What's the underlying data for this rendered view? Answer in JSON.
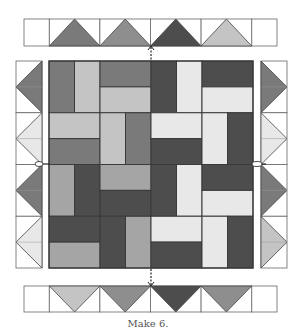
{
  "caption": "Make 6.",
  "colors": {
    "white": "#ffffff",
    "light": "#e8e8e8",
    "lightgray": "#c4c4c4",
    "mid": "#a5a5a5",
    "midgray": "#8e8e8e",
    "gray": "#7a7a7a",
    "dark": "#4d4d4d",
    "outline": "#3a3a3a"
  },
  "top_strip": {
    "direction": "up",
    "geese": [
      "gray",
      "midgray",
      "dark",
      "lightgray"
    ]
  },
  "bottom_strip": {
    "direction": "down",
    "geese": [
      "lightgray",
      "midgray",
      "dark",
      "midgray"
    ]
  },
  "left_strip": {
    "direction": "left",
    "geese": [
      "gray",
      "light",
      "gray",
      "light"
    ]
  },
  "right_strip": {
    "direction": "right",
    "geese": [
      "gray",
      "light",
      "gray",
      "lightgray"
    ]
  },
  "center_block": {
    "quadrants": [
      {
        "name": "top-left",
        "units": [
          {
            "pos": [
              0,
              0,
              1,
              2
            ],
            "color": "gray"
          },
          {
            "pos": [
              1,
              0,
              1,
              2
            ],
            "color": "lightgray"
          },
          {
            "pos": [
              2,
              0,
              2,
              1
            ],
            "color": "gray"
          },
          {
            "pos": [
              2,
              1,
              2,
              1
            ],
            "color": "lightgray"
          },
          {
            "pos": [
              0,
              2,
              2,
              1
            ],
            "color": "lightgray"
          },
          {
            "pos": [
              0,
              3,
              2,
              1
            ],
            "color": "gray"
          },
          {
            "pos": [
              2,
              2,
              1,
              2
            ],
            "color": "lightgray"
          },
          {
            "pos": [
              3,
              2,
              1,
              2
            ],
            "color": "gray"
          }
        ]
      },
      {
        "name": "top-right",
        "units": [
          {
            "pos": [
              0,
              0,
              1,
              2
            ],
            "color": "dark"
          },
          {
            "pos": [
              1,
              0,
              1,
              2
            ],
            "color": "light"
          },
          {
            "pos": [
              2,
              0,
              2,
              1
            ],
            "color": "dark"
          },
          {
            "pos": [
              2,
              1,
              2,
              1
            ],
            "color": "light"
          },
          {
            "pos": [
              0,
              2,
              2,
              1
            ],
            "color": "light"
          },
          {
            "pos": [
              0,
              3,
              2,
              1
            ],
            "color": "dark"
          },
          {
            "pos": [
              2,
              2,
              1,
              2
            ],
            "color": "light"
          },
          {
            "pos": [
              3,
              2,
              1,
              2
            ],
            "color": "dark"
          }
        ]
      },
      {
        "name": "bottom-left",
        "units": [
          {
            "pos": [
              0,
              0,
              1,
              2
            ],
            "color": "mid"
          },
          {
            "pos": [
              1,
              0,
              1,
              2
            ],
            "color": "dark"
          },
          {
            "pos": [
              2,
              0,
              2,
              1
            ],
            "color": "mid"
          },
          {
            "pos": [
              2,
              1,
              2,
              1
            ],
            "color": "dark"
          },
          {
            "pos": [
              0,
              2,
              2,
              1
            ],
            "color": "dark"
          },
          {
            "pos": [
              0,
              3,
              2,
              1
            ],
            "color": "mid"
          },
          {
            "pos": [
              2,
              2,
              1,
              2
            ],
            "color": "dark"
          },
          {
            "pos": [
              3,
              2,
              1,
              2
            ],
            "color": "mid"
          }
        ]
      },
      {
        "name": "bottom-right",
        "units": [
          {
            "pos": [
              0,
              0,
              1,
              2
            ],
            "color": "dark"
          },
          {
            "pos": [
              1,
              0,
              1,
              2
            ],
            "color": "light"
          },
          {
            "pos": [
              2,
              0,
              2,
              1
            ],
            "color": "dark"
          },
          {
            "pos": [
              2,
              1,
              2,
              1
            ],
            "color": "light"
          },
          {
            "pos": [
              0,
              2,
              2,
              1
            ],
            "color": "light"
          },
          {
            "pos": [
              0,
              3,
              2,
              1
            ],
            "color": "dark"
          },
          {
            "pos": [
              2,
              2,
              1,
              2
            ],
            "color": "light"
          },
          {
            "pos": [
              3,
              2,
              1,
              2
            ],
            "color": "dark"
          }
        ]
      }
    ]
  }
}
